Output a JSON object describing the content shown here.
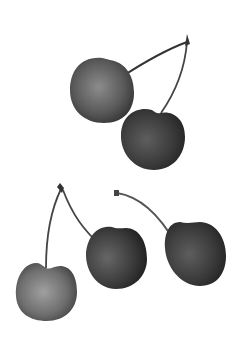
{
  "image": {
    "subject": "cherries",
    "style": "grayscale",
    "background": "#ffffff",
    "groups": [
      {
        "name": "top-pair",
        "cherries": 2
      },
      {
        "name": "bottom-pair",
        "cherries": 2
      },
      {
        "name": "single",
        "cherries": 1
      }
    ],
    "colors": {
      "dark": "#2a2a2a",
      "mid": "#555555",
      "light": "#8a8a8a",
      "stem": "#3a3a3a"
    }
  }
}
